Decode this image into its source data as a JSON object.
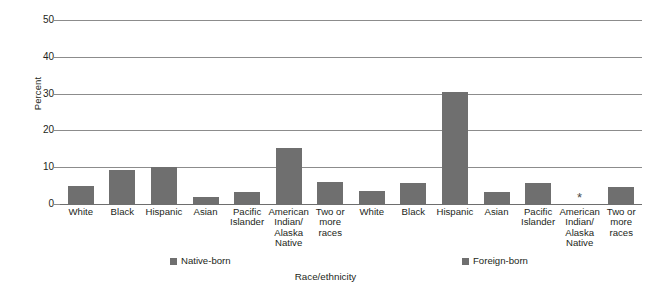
{
  "chart_data": {
    "type": "bar",
    "title": "",
    "xlabel": "Race/ethnicity",
    "ylabel": "Percent",
    "ylim": [
      0,
      50
    ],
    "ytick_labels": [
      "0",
      "10",
      "20",
      "30",
      "40",
      "50"
    ],
    "yticks": [
      0,
      10,
      20,
      30,
      40,
      50
    ],
    "grid": "horizontal",
    "legend_position": "bottom",
    "categories": [
      "White",
      "Black",
      "Hispanic",
      "Asian",
      "Pacific Islander",
      "American Indian/ Alaska Native",
      "Two or more races"
    ],
    "series": [
      {
        "name": "Native-born",
        "values": [
          5.0,
          9.3,
          10.1,
          1.9,
          3.4,
          15.2,
          5.9
        ],
        "labels": [
          "5.0",
          "9.3",
          "10.1",
          "1.9",
          "3.4",
          "15.2",
          "5.9"
        ]
      },
      {
        "name": "Foreign-born",
        "values": [
          3.5,
          5.7,
          30.5,
          3.2,
          5.8,
          null,
          4.5
        ],
        "labels": [
          "3.5",
          "5.7",
          "30.5",
          "3.2",
          "5.8",
          "*",
          "4.5"
        ]
      }
    ],
    "annotations": [
      {
        "text": "*",
        "series": "Foreign-born",
        "category": "American Indian/ Alaska Native",
        "meaning": "no-data-or-suppressed"
      }
    ],
    "colors": {
      "bar": "#6f6f6f",
      "gridline": "#8c8c8c",
      "text": "#231f20",
      "background": "#ffffff"
    }
  },
  "category_label_lines": [
    [
      "White"
    ],
    [
      "Black"
    ],
    [
      "Hispanic"
    ],
    [
      "Asian"
    ],
    [
      "Pacific",
      "Islander"
    ],
    [
      "American",
      "Indian/",
      "Alaska",
      "Native"
    ],
    [
      "Two or",
      "more",
      "races"
    ]
  ],
  "legend": {
    "native_born": "Native-born",
    "foreign_born": "Foreign-born"
  },
  "axes": {
    "y_title": "Percent",
    "x_title": "Race/ethnicity"
  }
}
